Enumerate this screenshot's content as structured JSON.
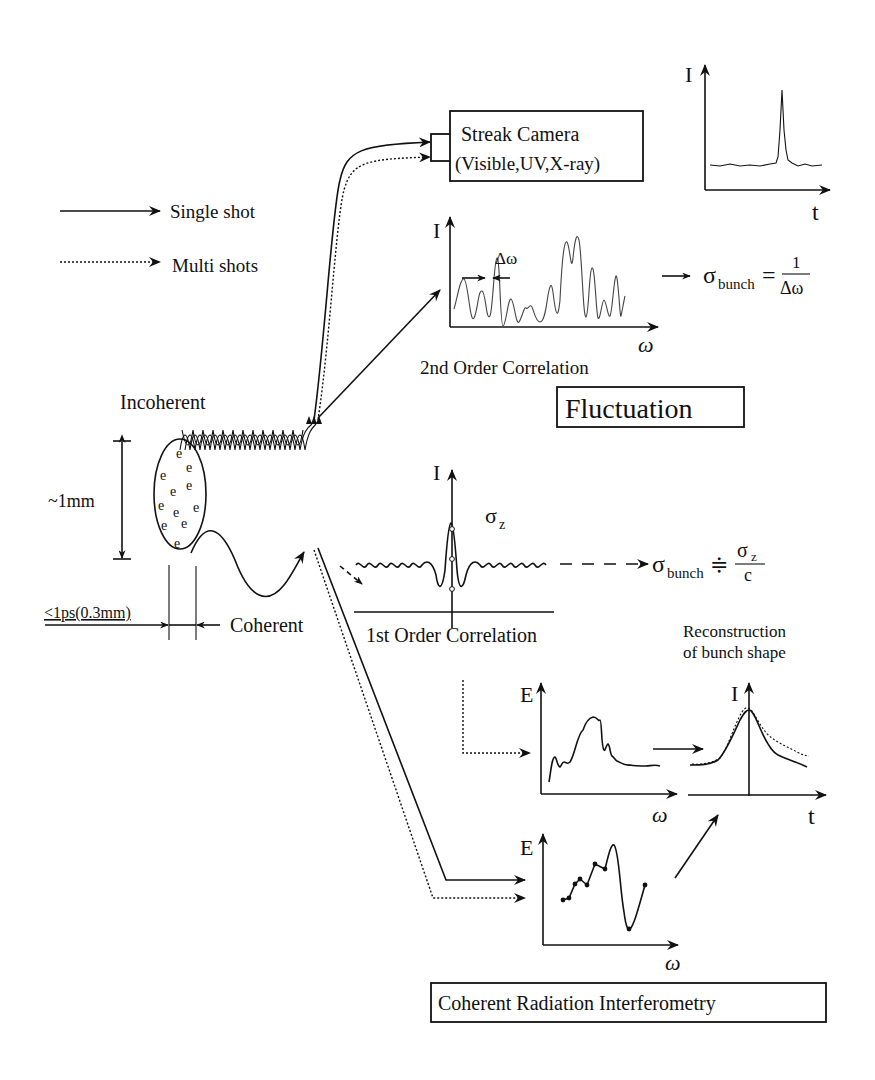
{
  "legend": {
    "single_shot": "Single shot",
    "multi_shots": "Multi shots"
  },
  "source": {
    "incoherent_label": "Incoherent",
    "coherent_label": "Coherent",
    "bunch_height": "~1mm",
    "bunch_length": "<1ps(0.3mm)",
    "electron_symbol": "e"
  },
  "streak_camera": {
    "title": "Streak Camera",
    "subtitle": "(Visible,UV,X-ray)",
    "plot": {
      "y_axis": "I",
      "x_axis": "t"
    }
  },
  "second_order": {
    "y_axis": "I",
    "x_axis": "ω",
    "delta_label": "Δω",
    "caption": "2nd Order Correlation",
    "formula_lhs": "σ",
    "formula_sub": "bunch",
    "formula_eq": "=",
    "formula_num": "1",
    "formula_den": "Δω"
  },
  "fluctuation_box": "Fluctuation",
  "first_order": {
    "y_axis": "I",
    "sigma_label": "σ",
    "sigma_sub": "z",
    "caption": "1st Order Correlation",
    "formula_lhs": "σ",
    "formula_sub": "bunch",
    "formula_eq": "≑",
    "formula_num": "σ",
    "formula_num_sub": "z",
    "formula_den": "c"
  },
  "reconstruction": {
    "title_line1": "Reconstruction",
    "title_line2": "of bunch shape",
    "y_axis": "I",
    "x_axis": "t"
  },
  "spectrum_plot": {
    "y_axis": "E",
    "x_axis": "ω"
  },
  "phase_plot": {
    "y_axis": "E",
    "x_axis": "ω"
  },
  "cri_box": "Coherent Radiation Interferometry"
}
